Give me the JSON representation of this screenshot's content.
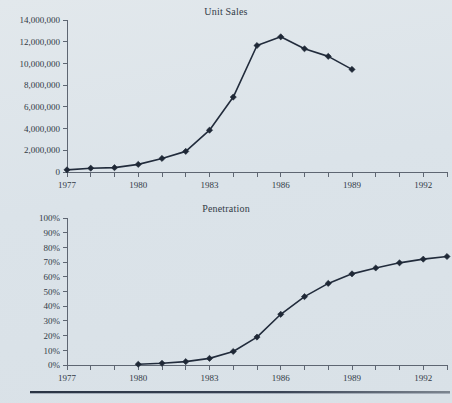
{
  "figure": {
    "background_color": "#dfe6ea",
    "line_color": "#222c3c",
    "axis_color": "#5e6672"
  },
  "chart_data": [
    {
      "type": "line",
      "title": "Unit Sales",
      "xlabel": "",
      "ylabel": "",
      "grid": false,
      "legend": "none",
      "xlim": [
        1977,
        1993
      ],
      "ylim": [
        0,
        14000000
      ],
      "ytick_labels": [
        "0",
        "2,000,000",
        "4,000,000",
        "6,000,000",
        "8,000,000",
        "10,000,000",
        "12,000,000",
        "14,000,000"
      ],
      "ytick_values": [
        0,
        2000000,
        4000000,
        6000000,
        8000000,
        10000000,
        12000000,
        14000000
      ],
      "xtick_values": [
        1977,
        1978,
        1979,
        1980,
        1981,
        1982,
        1983,
        1984,
        1985,
        1986,
        1987,
        1988,
        1989,
        1990,
        1991,
        1992,
        1993
      ],
      "xtick_labels": [
        "1977",
        "",
        "",
        "1980",
        "",
        "",
        "1983",
        "",
        "",
        "1986",
        "",
        "",
        "1989",
        "",
        "",
        "1992",
        ""
      ],
      "x": [
        1977,
        1978,
        1979,
        1980,
        1981,
        1982,
        1983,
        1984,
        1985,
        1986,
        1987,
        1988,
        1989
      ],
      "values": [
        200000,
        350000,
        400000,
        700000,
        1250000,
        1900000,
        3850000,
        6900000,
        11650000,
        12450000,
        11350000,
        10650000,
        9450000
      ]
    },
    {
      "type": "line",
      "title": "Penetration",
      "xlabel": "",
      "ylabel": "",
      "grid": false,
      "legend": "none",
      "xlim": [
        1977,
        1993
      ],
      "ylim": [
        0,
        100
      ],
      "ytick_labels": [
        "0%",
        "10%",
        "20%",
        "30%",
        "40%",
        "50%",
        "60%",
        "70%",
        "80%",
        "90%",
        "100%"
      ],
      "ytick_values": [
        0,
        10,
        20,
        30,
        40,
        50,
        60,
        70,
        80,
        90,
        100
      ],
      "xtick_values": [
        1977,
        1978,
        1979,
        1980,
        1981,
        1982,
        1983,
        1984,
        1985,
        1986,
        1987,
        1988,
        1989,
        1990,
        1991,
        1992,
        1993
      ],
      "xtick_labels": [
        "1977",
        "",
        "",
        "1980",
        "",
        "",
        "1983",
        "",
        "",
        "1986",
        "",
        "",
        "1989",
        "",
        "",
        "1992",
        ""
      ],
      "x": [
        1980,
        1981,
        1982,
        1983,
        1984,
        1985,
        1986,
        1987,
        1988,
        1989,
        1990,
        1991,
        1992,
        1993
      ],
      "values": [
        0.5,
        1.2,
        2.3,
        4.5,
        9.2,
        19.0,
        34.5,
        46.5,
        55.5,
        62.0,
        66.0,
        69.5,
        72.0,
        73.8
      ]
    }
  ]
}
